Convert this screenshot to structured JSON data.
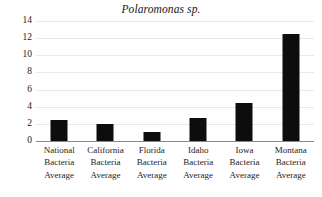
{
  "chart_data": {
    "type": "bar",
    "title": "Polaromonas sp.",
    "xlabel": "",
    "ylabel": "",
    "categories": [
      "National Bacteria Average",
      "California Bacteria Average",
      "Florida Bacteria Average",
      "Idaho Bacteria Average",
      "Iowa Bacteria Average",
      "Montana Bacteria Average"
    ],
    "category_lines": [
      [
        "National",
        "Bacteria",
        "Average"
      ],
      [
        "California",
        "Bacteria",
        "Average"
      ],
      [
        "Florida",
        "Bacteria",
        "Average"
      ],
      [
        "Idaho",
        "Bacteria",
        "Average"
      ],
      [
        "Iowa",
        "Bacteria",
        "Average"
      ],
      [
        "Montana",
        "Bacteria",
        "Average"
      ]
    ],
    "values": [
      2.5,
      2.0,
      1.1,
      2.7,
      4.4,
      12.5
    ],
    "ylim": [
      0,
      14
    ],
    "ytick_step": 2,
    "ytick_labels": [
      "0",
      "2",
      "4",
      "6",
      "8",
      "10",
      "12",
      "14"
    ],
    "grid": true,
    "legend": false,
    "bar_color": "#0d0d0d",
    "gridline_color": "#e9e9e9",
    "axis_color": "#8a8a8a",
    "background": "#ffffff"
  }
}
